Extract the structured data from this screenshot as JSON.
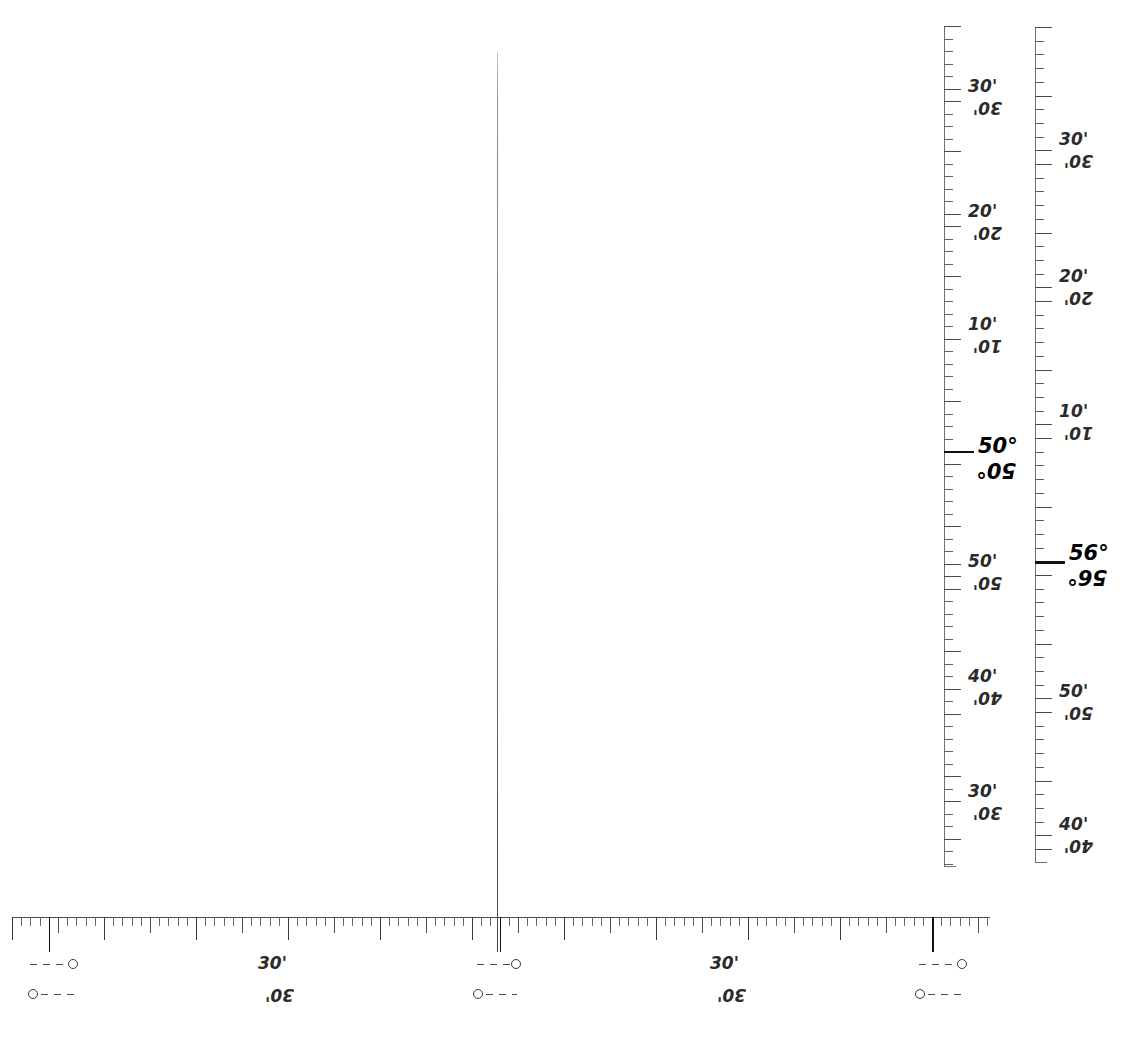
{
  "sheet": {
    "kind": "map-graticule-margin",
    "background": "#ffffff",
    "ink": "#2a2a2a"
  },
  "meridian": {
    "name": "central-meridian-line",
    "x": 497,
    "top": 52,
    "bottom": 952
  },
  "chart_data": {
    "type": "table",
    "xlabel": "Longitude minutes (bottom border scale)",
    "ylabel": "Latitude degrees and minutes (right border scales)",
    "grid": false,
    "legend": "none",
    "scales": [
      {
        "name": "left-latitude-scale",
        "orientation": "vertical",
        "axis_x": 944,
        "top": 26,
        "bottom": 866,
        "minor_tick_minutes": 1,
        "tick_spacing_px": 12.5,
        "major_every": 5,
        "labels": [
          {
            "text": "30'",
            "value": 30,
            "unit": "minute",
            "y": 95,
            "emphasis": "normal"
          },
          {
            "text": "20'",
            "value": 20,
            "unit": "minute",
            "y": 220,
            "emphasis": "normal"
          },
          {
            "text": "10'",
            "value": 10,
            "unit": "minute",
            "y": 333,
            "emphasis": "normal"
          },
          {
            "text": "50°",
            "value": 50,
            "unit": "degree",
            "y": 456,
            "emphasis": "bold"
          },
          {
            "text": "50'",
            "value": 50,
            "unit": "minute",
            "y": 570,
            "emphasis": "normal"
          },
          {
            "text": "40'",
            "value": 40,
            "unit": "minute",
            "y": 685,
            "emphasis": "normal"
          },
          {
            "text": "30'",
            "value": 30,
            "unit": "minute",
            "y": 800,
            "emphasis": "normal"
          }
        ]
      },
      {
        "name": "right-latitude-scale",
        "orientation": "vertical",
        "axis_x": 1035,
        "top": 27,
        "bottom": 862,
        "minor_tick_minutes": 1,
        "tick_spacing_px": 13.7,
        "major_every": 5,
        "labels": [
          {
            "text": "30'",
            "value": 30,
            "unit": "minute",
            "y": 148,
            "emphasis": "normal"
          },
          {
            "text": "20'",
            "value": 20,
            "unit": "minute",
            "y": 285,
            "emphasis": "normal"
          },
          {
            "text": "10'",
            "value": 10,
            "unit": "minute",
            "y": 420,
            "emphasis": "normal"
          },
          {
            "text": "56°",
            "value": 56,
            "unit": "degree",
            "y": 563,
            "emphasis": "bold"
          },
          {
            "text": "50'",
            "value": 50,
            "unit": "minute",
            "y": 700,
            "emphasis": "normal"
          },
          {
            "text": "40'",
            "value": 40,
            "unit": "minute",
            "y": 833,
            "emphasis": "normal"
          }
        ]
      },
      {
        "name": "bottom-longitude-scale",
        "orientation": "horizontal",
        "axis_y": 917,
        "left": 12,
        "right": 990,
        "minor_tick_minutes": 1,
        "tick_spacing_px": 9.2,
        "major_every": 5,
        "heavy_ticks_x": [
          46,
          497,
          935
        ],
        "labels": [
          {
            "text": "30'",
            "value": 30,
            "unit": "minute",
            "x": 258,
            "emphasis": "normal"
          },
          {
            "text": "30'",
            "value": 30,
            "unit": "minute",
            "x": 710,
            "emphasis": "normal"
          }
        ]
      }
    ],
    "tie_marks": [
      {
        "name": "tie-mark-1-upper",
        "x": 30,
        "y": 959,
        "width": 48,
        "dot_side": "right"
      },
      {
        "name": "tie-mark-1-lower",
        "x": 28,
        "y": 989,
        "width": 48,
        "dot_side": "left"
      },
      {
        "name": "tie-mark-2-upper",
        "x": 477,
        "y": 959,
        "width": 44,
        "dot_side": "right"
      },
      {
        "name": "tie-mark-2-lower",
        "x": 473,
        "y": 989,
        "width": 44,
        "dot_side": "left"
      },
      {
        "name": "tie-mark-3-upper",
        "x": 919,
        "y": 959,
        "width": 48,
        "dot_side": "right"
      },
      {
        "name": "tie-mark-3-lower",
        "x": 915,
        "y": 989,
        "width": 48,
        "dot_side": "left"
      }
    ]
  }
}
